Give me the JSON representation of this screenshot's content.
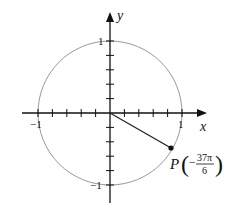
{
  "diagram": {
    "axes": {
      "x_label": "x",
      "y_label": "y"
    },
    "ticks": {
      "x_neg": "−1",
      "x_pos": "1",
      "y_pos": "1",
      "y_neg": "−1"
    },
    "point": {
      "name": "P",
      "numerator": "37π",
      "denominator": "6",
      "sign": "−",
      "angle_expression": "−37π/6"
    },
    "colors": {
      "circle": "#9a9a9a",
      "axis": "#111111",
      "segment": "#222222"
    }
  }
}
